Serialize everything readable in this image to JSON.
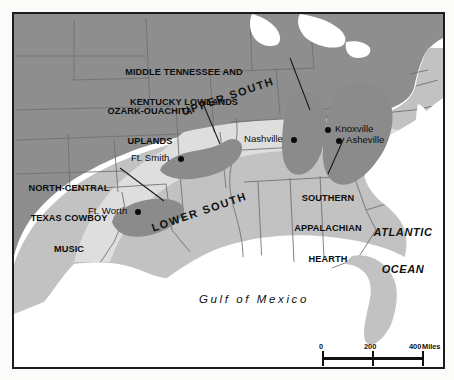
{
  "map": {
    "title": "Southern Music Hearths",
    "frame_color": "#1c1c1c",
    "colors": {
      "outside_south": "#8e8e8e",
      "upper_south_band": "#dedede",
      "lower_south_band": "#dedede",
      "south_general": "#c2c2c2",
      "hearth_blob": "#8b8b8b",
      "water": "#ffffff",
      "state_line": "#6f6f6f",
      "label_text": "#111111"
    },
    "regions": [
      {
        "id": "ozark-ouachita-uplands",
        "label": "OZARK-OUACHITA\nUPLANDS",
        "label_lines": [
          "OZARK-OUACHITA",
          "UPLANDS"
        ]
      },
      {
        "id": "middle-tennessee-kentucky-lowlands",
        "label": "MIDDLE TENNESSEE AND\nKENTUCKY LOWLANDS",
        "label_lines": [
          "MIDDLE TENNESSEE AND",
          "KENTUCKY LOWLANDS"
        ]
      },
      {
        "id": "north-central-texas-cowboy-music",
        "label": "NORTH-CENTRAL\nTEXAS COWBOY\nMUSIC",
        "label_lines": [
          "NORTH-CENTRAL",
          "TEXAS COWBOY",
          "MUSIC"
        ]
      },
      {
        "id": "southern-appalachian-hearth",
        "label": "SOUTHERN\nAPPALACHIAN\nHEARTH",
        "label_lines": [
          "SOUTHERN",
          "APPALACHIAN",
          "HEARTH"
        ]
      }
    ],
    "bands": [
      {
        "id": "upper-south",
        "label": "UPPER SOUTH"
      },
      {
        "id": "lower-south",
        "label": "LOWER SOUTH"
      }
    ],
    "cities": [
      {
        "id": "ft-smith",
        "label": "Ft. Smith",
        "dot_side": "right"
      },
      {
        "id": "ft-worth",
        "label": "Ft. Worth",
        "dot_side": "right"
      },
      {
        "id": "nashville",
        "label": "Nashville",
        "dot_side": "right"
      },
      {
        "id": "knoxville",
        "label": "Knoxville",
        "dot_side": "left"
      },
      {
        "id": "asheville",
        "label": "Asheville",
        "dot_side": "left"
      }
    ],
    "water_bodies": [
      {
        "id": "gulf-of-mexico",
        "label": "Gulf of Mexico"
      },
      {
        "id": "atlantic-ocean",
        "label": "ATLANTIC\nOCEAN",
        "label_lines": [
          "ATLANTIC",
          "OCEAN"
        ]
      }
    ],
    "scale": {
      "miles": {
        "ticks": [
          "0",
          "200",
          "400"
        ],
        "unit": "Miles"
      },
      "kilometers": {
        "ticks": [
          "0",
          "200",
          "400"
        ],
        "unit": "Kilometers"
      }
    }
  }
}
